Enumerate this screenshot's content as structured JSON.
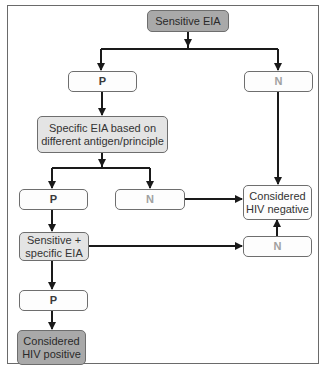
{
  "diagram": {
    "nodes": {
      "sensitive_eia": "Sensitive EIA",
      "p1": "P",
      "n1": "N",
      "specific_eia": "Specific EIA based on different antigen/principle",
      "specific_eia_line1": "Specific EIA based on",
      "specific_eia_line2": "different antigen/principle",
      "p2": "P",
      "n2": "N",
      "hiv_negative_line1": "Considered",
      "hiv_negative_line2": "HIV negative",
      "sens_spec_line1": "Sensitive +",
      "sens_spec_line2": "specific EIA",
      "n3": "N",
      "p3": "P",
      "hiv_positive_line1": "Considered",
      "hiv_positive_line2": "HIV positive"
    },
    "edges": [
      {
        "from": "Sensitive EIA",
        "to": "P"
      },
      {
        "from": "Sensitive EIA",
        "to": "N"
      },
      {
        "from": "P",
        "to": "Specific EIA based on different antigen/principle"
      },
      {
        "from": "N",
        "to": "Considered HIV negative"
      },
      {
        "from": "Specific EIA based on different antigen/principle",
        "to": "P"
      },
      {
        "from": "Specific EIA based on different antigen/principle",
        "to": "N"
      },
      {
        "from": "N",
        "to": "Considered HIV negative"
      },
      {
        "from": "P",
        "to": "Sensitive + specific EIA"
      },
      {
        "from": "Sensitive + specific EIA",
        "to": "N"
      },
      {
        "from": "N",
        "to": "Considered HIV negative"
      },
      {
        "from": "Sensitive + specific EIA",
        "to": "P"
      },
      {
        "from": "P",
        "to": "Considered HIV positive"
      }
    ],
    "colors": {
      "dark_fill": "#a9a9a9",
      "light_fill": "#e4e4e4",
      "white_fill": "#fdfdfd",
      "line": "#1a1a1a",
      "n_text": "#a0a0a0"
    }
  }
}
